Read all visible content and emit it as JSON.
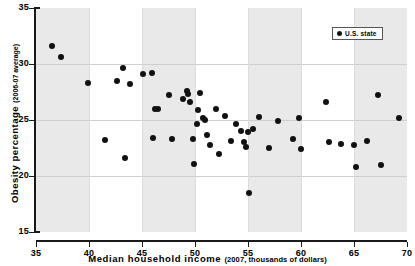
{
  "chart_data": {
    "type": "scatter",
    "title": "",
    "xlabel": "Median household income",
    "xlabel_sub": "(2007, thousands of dollars)",
    "ylabel": "Obesity percentage",
    "ylabel_sub": "(2006-07 average)",
    "xlim": [
      35,
      70
    ],
    "ylim": [
      15,
      35
    ],
    "xticks": [
      35,
      40,
      45,
      50,
      55,
      60,
      65,
      70
    ],
    "xticklabels": [
      "35",
      "40",
      "45",
      "50",
      "55",
      "60",
      "65",
      "70"
    ],
    "yticks": [
      15,
      20,
      25,
      30,
      35
    ],
    "yticklabels": [
      "15",
      "20",
      "25",
      "30",
      "35"
    ],
    "grid": true,
    "legend": {
      "position": "top-right",
      "entries": [
        {
          "label": "U.S. state",
          "marker": "circle",
          "color": "#111111"
        }
      ]
    },
    "shaded_bands": [
      [
        35,
        40
      ],
      [
        45,
        50
      ],
      [
        55,
        60
      ],
      [
        65,
        70
      ]
    ],
    "series": [
      {
        "name": "U.S. state",
        "color": "#111111",
        "marker": "circle",
        "points": [
          [
            36.5,
            31.6
          ],
          [
            37.4,
            30.6
          ],
          [
            39.9,
            28.3
          ],
          [
            41.5,
            23.2
          ],
          [
            42.6,
            28.5
          ],
          [
            43.2,
            29.6
          ],
          [
            43.4,
            21.6
          ],
          [
            43.9,
            28.2
          ],
          [
            45.1,
            29.1
          ],
          [
            45.9,
            29.2
          ],
          [
            46.0,
            23.4
          ],
          [
            46.2,
            26.0
          ],
          [
            46.5,
            26.0
          ],
          [
            47.5,
            27.2
          ],
          [
            47.8,
            23.3
          ],
          [
            48.9,
            26.9
          ],
          [
            49.2,
            27.6
          ],
          [
            49.3,
            27.3
          ],
          [
            49.5,
            26.6
          ],
          [
            49.8,
            23.3
          ],
          [
            49.9,
            21.1
          ],
          [
            50.2,
            24.6
          ],
          [
            50.3,
            25.9
          ],
          [
            50.5,
            27.4
          ],
          [
            50.8,
            25.2
          ],
          [
            50.9,
            25.0
          ],
          [
            51.1,
            23.7
          ],
          [
            51.4,
            22.8
          ],
          [
            52.0,
            26.0
          ],
          [
            52.3,
            22.0
          ],
          [
            52.8,
            25.4
          ],
          [
            53.4,
            23.1
          ],
          [
            53.9,
            24.6
          ],
          [
            54.3,
            24.0
          ],
          [
            54.6,
            23.0
          ],
          [
            54.8,
            22.6
          ],
          [
            55.0,
            23.9
          ],
          [
            55.1,
            18.5
          ],
          [
            55.5,
            24.2
          ],
          [
            56.0,
            25.3
          ],
          [
            57.0,
            22.5
          ],
          [
            57.8,
            24.9
          ],
          [
            59.2,
            23.3
          ],
          [
            59.8,
            25.2
          ],
          [
            60.0,
            22.4
          ],
          [
            62.4,
            26.6
          ],
          [
            62.6,
            23.0
          ],
          [
            63.8,
            22.9
          ],
          [
            65.0,
            22.8
          ],
          [
            65.2,
            20.8
          ],
          [
            66.2,
            23.1
          ],
          [
            67.3,
            27.2
          ],
          [
            67.5,
            21.0
          ],
          [
            69.2,
            25.2
          ]
        ]
      }
    ]
  }
}
